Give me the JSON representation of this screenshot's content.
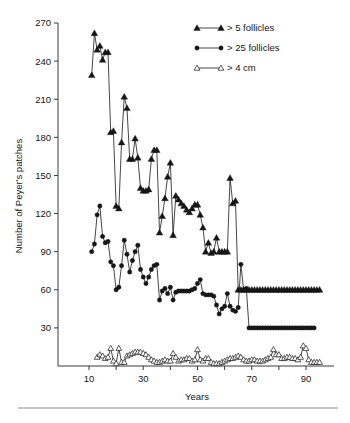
{
  "chart_data": {
    "type": "line",
    "title": "",
    "xlabel": "Years",
    "ylabel": "Number of Peyer's patches",
    "xlim": [
      5,
      98
    ],
    "ylim": [
      0,
      270
    ],
    "xticks": [
      10,
      30,
      50,
      70,
      90
    ],
    "yticks": [
      30,
      60,
      90,
      120,
      150,
      180,
      210,
      240,
      270
    ],
    "grid": false,
    "legend_position": "top-right",
    "series": [
      {
        "name": "> 5 follicles",
        "marker": "filled-triangle",
        "x": [
          11,
          12,
          13,
          14,
          15,
          16,
          17,
          18,
          19,
          20,
          21,
          22,
          23,
          24,
          25,
          26,
          27,
          28,
          29,
          30,
          31,
          32,
          33,
          34,
          35,
          36,
          37,
          38,
          39,
          40,
          41,
          42,
          43,
          44,
          45,
          46,
          47,
          48,
          49,
          50,
          51,
          52,
          53,
          54,
          55,
          56,
          57,
          58,
          59,
          60,
          61,
          62,
          63,
          64,
          65,
          66,
          67,
          68,
          69,
          70,
          71,
          72,
          73,
          74,
          75,
          76,
          77,
          78,
          79,
          80,
          81,
          82,
          83,
          84,
          85,
          86,
          87,
          88,
          89,
          90,
          91,
          92,
          93,
          94,
          95
        ],
        "y": [
          229,
          262,
          249,
          252,
          241,
          247,
          247,
          184,
          185,
          126,
          124,
          176,
          212,
          203,
          163,
          163,
          179,
          164,
          140,
          138,
          138,
          139,
          163,
          170,
          170,
          105,
          118,
          132,
          149,
          160,
          103,
          134,
          131,
          128,
          126,
          123,
          121,
          124,
          127,
          127,
          119,
          109,
          90,
          97,
          89,
          90,
          101,
          90,
          90,
          90,
          90,
          148,
          128,
          130,
          60,
          60,
          60,
          60,
          60,
          60,
          60,
          60,
          60,
          60,
          60,
          60,
          60,
          60,
          60,
          60,
          60,
          60,
          60,
          60,
          60,
          60,
          60,
          60,
          60,
          60,
          60,
          60,
          60,
          60,
          60
        ]
      },
      {
        "name": "> 25 follicles",
        "marker": "filled-circle",
        "x": [
          11,
          12,
          13,
          14,
          15,
          16,
          17,
          18,
          19,
          20,
          21,
          22,
          23,
          24,
          25,
          26,
          27,
          28,
          29,
          30,
          31,
          32,
          33,
          34,
          35,
          36,
          37,
          38,
          39,
          40,
          41,
          42,
          43,
          44,
          45,
          46,
          47,
          48,
          49,
          50,
          51,
          52,
          53,
          54,
          55,
          56,
          57,
          58,
          59,
          60,
          61,
          62,
          63,
          64,
          65,
          66,
          67,
          68,
          69,
          70,
          71,
          72,
          73,
          74,
          75,
          76,
          77,
          78,
          79,
          80,
          81,
          82,
          83,
          84,
          85,
          86,
          87,
          88,
          89,
          90,
          91,
          92,
          93
        ],
        "y": [
          90,
          96,
          119,
          126,
          102,
          97,
          98,
          82,
          79,
          60,
          62,
          79,
          99,
          88,
          74,
          83,
          90,
          95,
          76,
          70,
          65,
          70,
          76,
          79,
          80,
          52,
          59,
          61,
          57,
          62,
          52,
          58,
          59,
          59,
          59,
          59,
          59,
          60,
          61,
          65,
          68,
          57,
          56,
          56,
          56,
          55,
          48,
          41,
          45,
          47,
          57,
          47,
          44,
          43,
          46,
          80,
          60,
          61,
          30,
          30,
          30,
          30,
          30,
          30,
          30,
          30,
          30,
          30,
          30,
          30,
          30,
          30,
          30,
          30,
          30,
          30,
          30,
          30,
          30,
          30,
          30,
          30,
          30
        ]
      },
      {
        "name": "> 4 cm",
        "marker": "open-triangle",
        "x": [
          13,
          14,
          15,
          16,
          17,
          18,
          19,
          20,
          21,
          22,
          23,
          24,
          25,
          26,
          27,
          28,
          29,
          30,
          31,
          32,
          33,
          34,
          35,
          36,
          37,
          38,
          39,
          40,
          41,
          42,
          43,
          44,
          45,
          46,
          47,
          48,
          49,
          50,
          51,
          52,
          53,
          54,
          55,
          56,
          57,
          58,
          59,
          60,
          61,
          62,
          63,
          64,
          65,
          66,
          67,
          68,
          69,
          70,
          71,
          72,
          73,
          74,
          75,
          76,
          77,
          78,
          79,
          80,
          81,
          82,
          83,
          84,
          85,
          86,
          87,
          88,
          89,
          90,
          91,
          92,
          93,
          94,
          95
        ],
        "y": [
          7,
          9,
          8,
          6,
          7,
          14,
          4,
          2,
          14,
          3,
          3,
          8,
          9,
          10,
          11,
          11,
          11,
          10,
          9,
          7,
          5,
          4,
          3,
          3,
          4,
          5,
          4,
          4,
          10,
          7,
          4,
          5,
          5,
          6,
          6,
          4,
          5,
          13,
          5,
          4,
          6,
          6,
          3,
          2,
          2,
          2,
          3,
          4,
          5,
          6,
          6,
          7,
          8,
          7,
          5,
          4,
          4,
          5,
          5,
          4,
          4,
          4,
          5,
          6,
          7,
          13,
          9,
          9,
          6,
          6,
          7,
          7,
          6,
          6,
          5,
          7,
          16,
          14,
          5,
          3,
          3,
          3,
          3
        ]
      }
    ]
  },
  "axes": {
    "y_title": "Number of Peyer's patches",
    "x_title": "Years",
    "y_tick_labels": [
      "270",
      "240",
      "210",
      "180",
      "150",
      "120",
      "90",
      "60",
      "30"
    ],
    "x_tick_labels": [
      "10",
      "30",
      "50",
      "70",
      "90"
    ]
  },
  "legend": {
    "entries": [
      {
        "label": ">   5 follicles",
        "marker": "filled-triangle"
      },
      {
        "label": "> 25 follicles",
        "marker": "filled-circle"
      },
      {
        "label": ">   4 cm",
        "marker": "open-triangle"
      }
    ]
  },
  "colors": {
    "ink": "#161616",
    "axis": "#3a3a3a",
    "rule": "#8c8c8c",
    "background": "#ffffff"
  }
}
